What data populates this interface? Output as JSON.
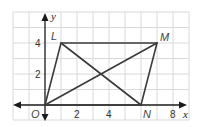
{
  "diagram": {
    "type": "coordinate-plane-parallelogram",
    "axes": {
      "x_label": "x",
      "y_label": "y",
      "origin_label": "O",
      "x_ticks": [
        {
          "value": 2,
          "label": "2"
        },
        {
          "value": 4,
          "label": "4"
        },
        {
          "value": 8,
          "label": "8"
        }
      ],
      "y_ticks": [
        {
          "value": 2,
          "label": "2"
        },
        {
          "value": 4,
          "label": "4"
        }
      ],
      "x_range": [
        -2,
        9
      ],
      "y_range": [
        -1,
        6
      ]
    },
    "points": {
      "O": {
        "label": "O",
        "x": 0,
        "y": 0
      },
      "L": {
        "label": "L",
        "x": 1,
        "y": 4
      },
      "M": {
        "label": "M",
        "x": 7,
        "y": 4
      },
      "N": {
        "label": "N",
        "x": 6,
        "y": 0
      }
    },
    "polygon": [
      "O",
      "L",
      "M",
      "N"
    ],
    "diagonals": [
      [
        "O",
        "M"
      ],
      [
        "L",
        "N"
      ]
    ],
    "colors": {
      "grid": "#d9d9d9",
      "axis": "#1a1a1a",
      "shape": "#3a3a3a",
      "background": "#ffffff"
    }
  }
}
